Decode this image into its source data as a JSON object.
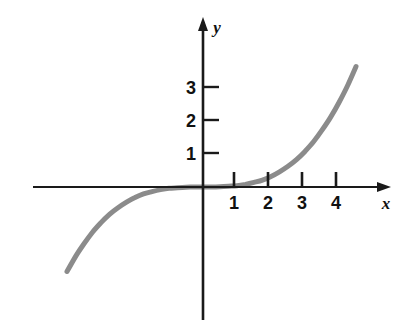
{
  "figure": {
    "title": "",
    "background_color": "#ffffff"
  },
  "axes": {
    "x_axis": {
      "name": "x-axis",
      "label": "x",
      "label_style": "italic",
      "arrow": "right",
      "color": "#1a1a1a",
      "tick_labels": [
        "1",
        "2",
        "3",
        "4"
      ],
      "tick_values": [
        1,
        2,
        3,
        4
      ],
      "ticks_direction": "up",
      "range": [
        -5,
        5.2
      ]
    },
    "y_axis": {
      "name": "y-axis",
      "label": "y",
      "label_style": "italic",
      "arrow": "up",
      "color": "#1a1a1a",
      "tick_labels": [
        "1",
        "2",
        "3"
      ],
      "tick_values": [
        1,
        2,
        3
      ],
      "ticks_direction": "right",
      "range": [
        -4.2,
        5.2
      ]
    },
    "origin_label": ""
  },
  "chart_data": {
    "type": "line",
    "title": "",
    "xlabel": "x",
    "ylabel": "y",
    "xlim": [
      -5,
      5.2
    ],
    "ylim": [
      -4.2,
      5.2
    ],
    "grid": false,
    "legend": null,
    "series": [
      {
        "name": "y = x^3 / 25",
        "color": "#8b8b8b",
        "linewidth": 5,
        "x": [
          -4.0,
          -3.75,
          -3.5,
          -3.25,
          -3.0,
          -2.75,
          -2.5,
          -2.25,
          -2.0,
          -1.75,
          -1.5,
          -1.25,
          -1.0,
          -0.75,
          -0.5,
          -0.25,
          0.0,
          0.25,
          0.5,
          0.75,
          1.0,
          1.25,
          1.5,
          1.75,
          2.0,
          2.25,
          2.5,
          2.75,
          3.0,
          3.25,
          3.5,
          3.75,
          4.0,
          4.25,
          4.5,
          4.75,
          5.0,
          5.2
        ],
        "y": [
          -2.56,
          -2.11,
          -1.72,
          -1.37,
          -1.08,
          -0.83,
          -0.63,
          -0.46,
          -0.32,
          -0.21,
          -0.14,
          -0.08,
          -0.04,
          -0.02,
          -0.005,
          -0.001,
          0.0,
          0.001,
          0.005,
          0.02,
          0.04,
          0.08,
          0.14,
          0.21,
          0.32,
          0.46,
          0.63,
          0.83,
          1.08,
          1.37,
          1.72,
          2.11,
          2.56,
          3.07,
          3.65,
          4.29,
          5.0,
          5.63
        ]
      }
    ],
    "annotations": []
  }
}
